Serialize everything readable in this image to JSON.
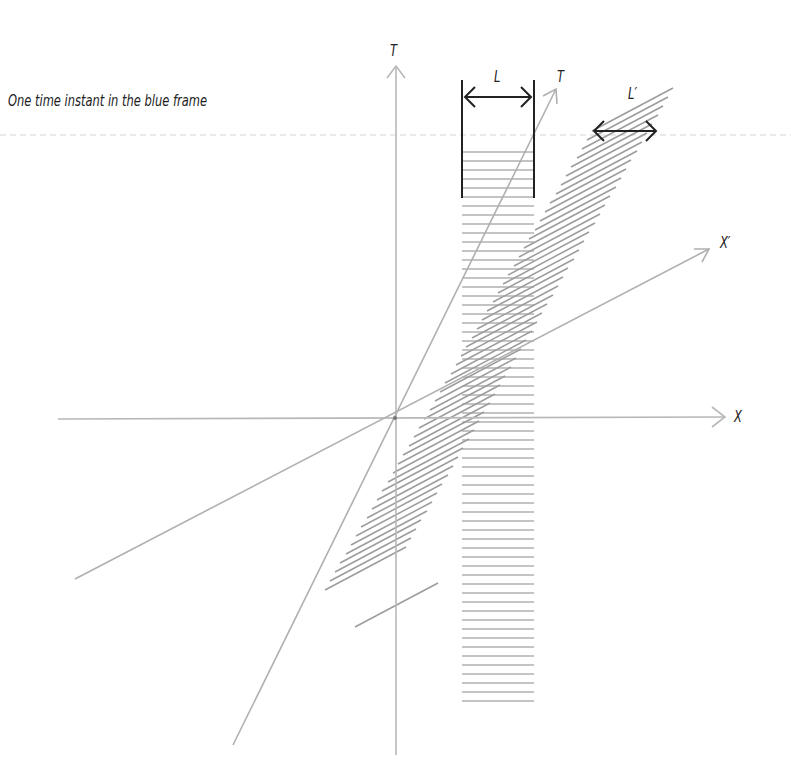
{
  "caption": "One time instant in the blue frame",
  "labels": {
    "t_axis": "T",
    "t_prime_axis": "T",
    "x_axis": "X",
    "x_prime_axis": "X′",
    "length": "L",
    "length_prime": "L′"
  },
  "colors": {
    "axis": "#b8b8b8",
    "hatch": "#a8a8a8",
    "arrow": "#222222",
    "dashed_line": "#e2e2e2",
    "text": "#222222"
  }
}
